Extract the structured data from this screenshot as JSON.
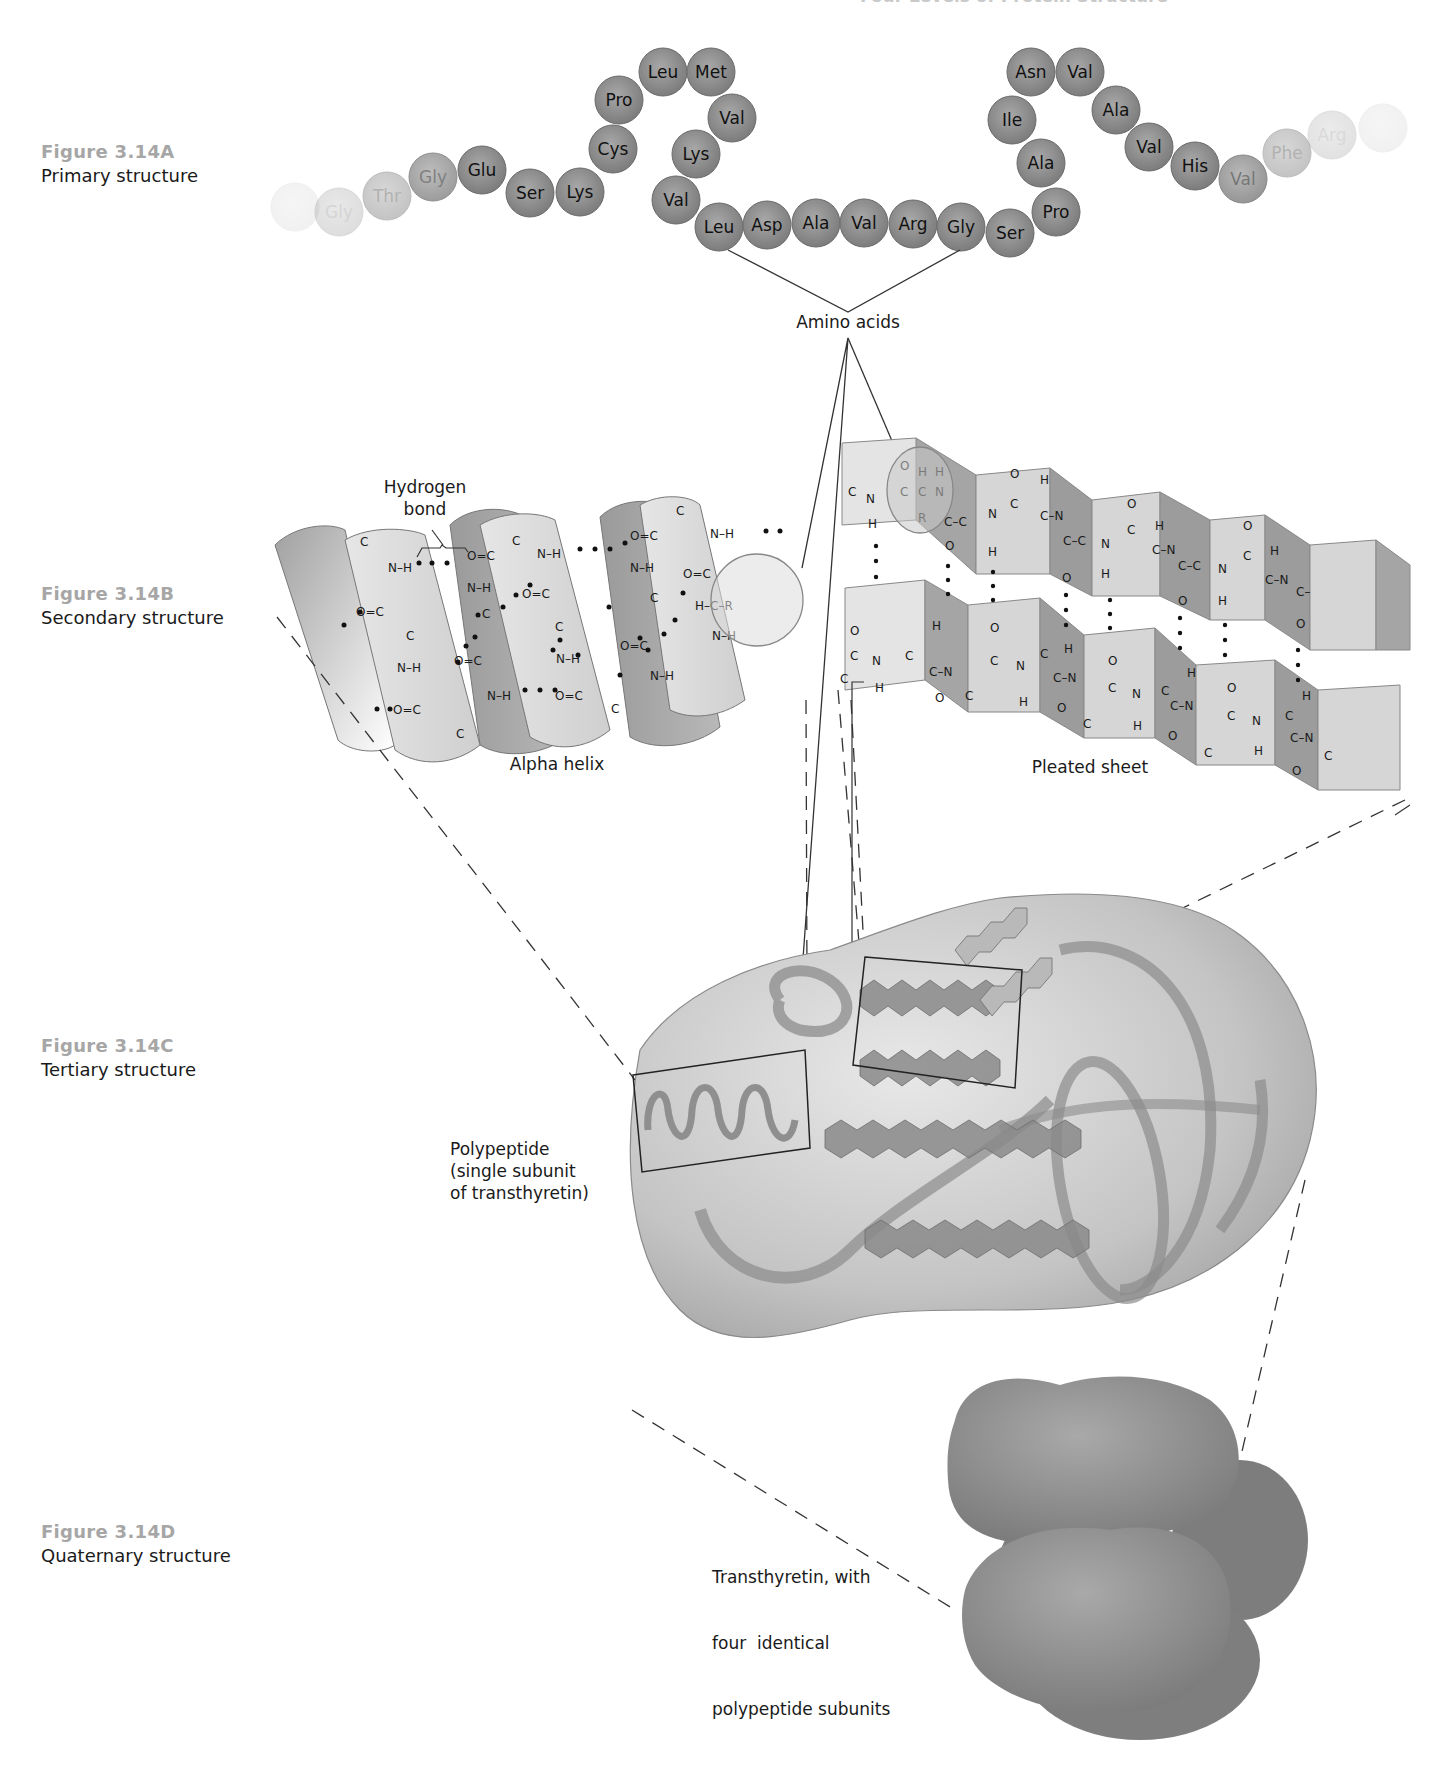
{
  "title": "Four Levels of Protein Structure",
  "figures": [
    {
      "number": "Figure 3.14A",
      "description": "Primary structure"
    },
    {
      "number": "Figure 3.14B",
      "description": "Secondary structure"
    },
    {
      "number": "Figure 3.14C",
      "description": "Tertiary structure"
    },
    {
      "number": "Figure 3.14D",
      "description": "Quaternary structure"
    }
  ],
  "primary": {
    "amino_acid_chain": [
      {
        "name": "",
        "x": 295,
        "y": 207,
        "fade": 0.1
      },
      {
        "name": "Gly",
        "x": 339,
        "y": 212,
        "fade": 0.25
      },
      {
        "name": "Thr",
        "x": 387,
        "y": 196,
        "fade": 0.45
      },
      {
        "name": "Gly",
        "x": 433,
        "y": 177,
        "fade": 0.75
      },
      {
        "name": "Glu",
        "x": 482,
        "y": 170,
        "fade": 1
      },
      {
        "name": "Ser",
        "x": 530,
        "y": 193,
        "fade": 1
      },
      {
        "name": "Lys",
        "x": 580,
        "y": 192,
        "fade": 1
      },
      {
        "name": "Cys",
        "x": 613,
        "y": 149,
        "fade": 1
      },
      {
        "name": "Pro",
        "x": 619,
        "y": 100,
        "fade": 1
      },
      {
        "name": "Leu",
        "x": 663,
        "y": 72,
        "fade": 1
      },
      {
        "name": "Met",
        "x": 711,
        "y": 72,
        "fade": 1
      },
      {
        "name": "Val",
        "x": 732,
        "y": 118,
        "fade": 1
      },
      {
        "name": "Lys",
        "x": 696,
        "y": 154,
        "fade": 1
      },
      {
        "name": "Val",
        "x": 676,
        "y": 200,
        "fade": 1
      },
      {
        "name": "Leu",
        "x": 719,
        "y": 227,
        "fade": 1
      },
      {
        "name": "Asp",
        "x": 767,
        "y": 225,
        "fade": 1
      },
      {
        "name": "Ala",
        "x": 816,
        "y": 223,
        "fade": 1
      },
      {
        "name": "Val",
        "x": 864,
        "y": 223,
        "fade": 1
      },
      {
        "name": "Arg",
        "x": 913,
        "y": 224,
        "fade": 1
      },
      {
        "name": "Gly",
        "x": 961,
        "y": 227,
        "fade": 1
      },
      {
        "name": "Ser",
        "x": 1010,
        "y": 233,
        "fade": 1
      },
      {
        "name": "Pro",
        "x": 1056,
        "y": 212,
        "fade": 1
      },
      {
        "name": "Ala",
        "x": 1041,
        "y": 163,
        "fade": 1
      },
      {
        "name": "Ile",
        "x": 1012,
        "y": 120,
        "fade": 1
      },
      {
        "name": "Asn",
        "x": 1031,
        "y": 72,
        "fade": 1
      },
      {
        "name": "Val",
        "x": 1080,
        "y": 72,
        "fade": 1
      },
      {
        "name": "Ala",
        "x": 1116,
        "y": 110,
        "fade": 1
      },
      {
        "name": "Val",
        "x": 1149,
        "y": 147,
        "fade": 1
      },
      {
        "name": "His",
        "x": 1195,
        "y": 166,
        "fade": 1
      },
      {
        "name": "Val",
        "x": 1243,
        "y": 179,
        "fade": 0.8
      },
      {
        "name": "Phe",
        "x": 1287,
        "y": 153,
        "fade": 0.45
      },
      {
        "name": "Arg",
        "x": 1332,
        "y": 135,
        "fade": 0.22
      },
      {
        "name": "",
        "x": 1383,
        "y": 128,
        "fade": 0.1
      }
    ],
    "label": "Amino acids"
  },
  "secondary": {
    "alpha_helix_label": "Alpha helix",
    "hydrogen_bond_label": [
      "Hydrogen",
      "bond"
    ],
    "pleated_sheet_label": "Pleated sheet",
    "helix_groups": [
      "C",
      "N–H",
      "O=C",
      "C",
      "N–H",
      "O=C",
      "C",
      "O=C",
      "N–H",
      "C",
      "O=C",
      "N–H",
      "C",
      "N–H",
      "O=C",
      "N–H",
      "O=C",
      "C",
      "N–H",
      "O=C",
      "C",
      "O=C",
      "N–H",
      "C",
      "O=C",
      "N–H",
      "C",
      "N–H",
      "O=C",
      "H–C–R",
      "N–H"
    ]
  },
  "tertiary": {
    "label": [
      "Polypeptide",
      "(single subunit",
      "of transthyretin)"
    ]
  },
  "quaternary": {
    "label": [
      "Transthyretin, with",
      "four  identical",
      "polypeptide subunits"
    ]
  }
}
